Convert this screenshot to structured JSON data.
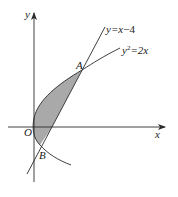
{
  "figure": {
    "axes": {
      "x_label": "x",
      "y_label": "y",
      "origin_label": "O"
    },
    "curves": [
      {
        "name": "line",
        "label_prefix": "y=x",
        "label_suffix": "−4"
      },
      {
        "name": "parabola",
        "label_base": "y",
        "label_exp": "2",
        "label_rest": "=2x"
      }
    ],
    "points": [
      {
        "name": "A",
        "label": "A"
      },
      {
        "name": "B",
        "label": "B"
      }
    ],
    "colors": {
      "stroke": "#2a2a2a",
      "shade": "#a9a9a9",
      "background": "#ffffff"
    }
  }
}
